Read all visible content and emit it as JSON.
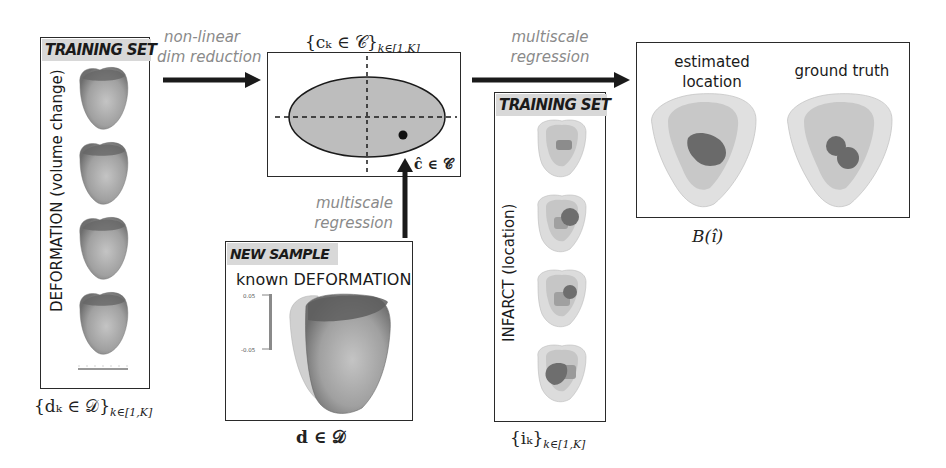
{
  "left_panel": {
    "tag": "TRAINING SET",
    "vertical_label": "DEFORMATION (volume change)",
    "caption": "{d_k ∈ 𝒟}_{k∈[1,K]}",
    "caption_main": "{dₖ ∈ 𝒟}",
    "caption_sub": "k∈[1,K]",
    "heart_count": 4
  },
  "arrow1": {
    "label_line1": "non-linear",
    "label_line2": "dim reduction"
  },
  "latent_panel": {
    "caption_main": "{cₖ ∈ 𝒞}",
    "caption_sub": "k∈[1,K]",
    "point_label": "ĉ ∈ 𝒞"
  },
  "arrow_up": {
    "label_line1": "multiscale",
    "label_line2": "regression"
  },
  "new_sample_panel": {
    "tag": "NEW SAMPLE",
    "heading": "known DEFORMATION",
    "colorbar_top": "0.05",
    "colorbar_bottom": "-0.05",
    "caption": "d ∈ 𝒟"
  },
  "arrow2": {
    "label_line1": "multiscale",
    "label_line2": "regression"
  },
  "infarct_panel": {
    "tag": "TRAINING SET",
    "vertical_label": "INFARCT (location)",
    "caption_main": "{iₖ}",
    "caption_sub": "k∈[1,K]",
    "heart_count": 4
  },
  "result_panel": {
    "left_heading_line1": "estimated",
    "left_heading_line2": "location",
    "right_heading": "ground truth",
    "caption": "B(î)"
  },
  "colors": {
    "stroke": "#1a1a1a",
    "ellipse_fill": "#bdbdbd",
    "tag_bg": "#d8d8d8",
    "label_gray": "#8a8a8a",
    "heart_dark": "#6e6e6e",
    "heart_mid": "#a8a8a8",
    "heart_light": "#d9d9d9",
    "infarct": "#6a6a6a"
  }
}
